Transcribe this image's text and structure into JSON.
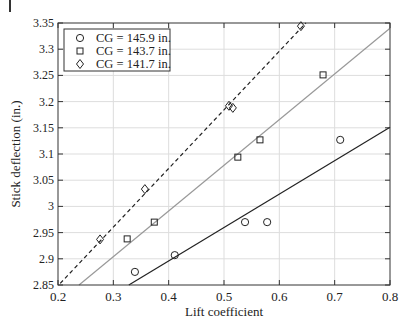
{
  "chart_data": {
    "type": "scatter",
    "title": "",
    "xlabel": "Lift coefficient",
    "ylabel": "Stick deflection (in.)",
    "xlim": [
      0.2,
      0.8
    ],
    "ylim": [
      2.85,
      3.35
    ],
    "grid": true,
    "legend_position": "upper left",
    "xticks": [
      "0.2",
      "0.3",
      "0.4",
      "0.5",
      "0.6",
      "0.7",
      "0.8"
    ],
    "yticks": [
      "2.85",
      "2.9",
      "2.95",
      "3",
      "3.05",
      "3.1",
      "3.15",
      "3.2",
      "3.25",
      "3.3",
      "3.35"
    ],
    "series": [
      {
        "name": "CG = 145.9 in.",
        "marker": "circle",
        "points": [
          [
            0.339,
            2.875
          ],
          [
            0.411,
            2.907
          ],
          [
            0.538,
            2.97
          ],
          [
            0.578,
            2.97
          ],
          [
            0.71,
            3.127
          ]
        ],
        "fit_line": {
          "style": "solid",
          "color": "#222222",
          "from": [
            0.328,
            2.85
          ],
          "to": [
            0.8,
            3.151
          ]
        }
      },
      {
        "name": "CG = 143.7 in.",
        "marker": "square",
        "points": [
          [
            0.325,
            2.938
          ],
          [
            0.374,
            2.97
          ],
          [
            0.525,
            3.094
          ],
          [
            0.565,
            3.127
          ],
          [
            0.679,
            3.251
          ]
        ],
        "fit_line": {
          "style": "solid",
          "color": "#999999",
          "from": [
            0.238,
            2.85
          ],
          "to": [
            0.8,
            3.34
          ]
        }
      },
      {
        "name": "CG = 141.7 in.",
        "marker": "diamond",
        "points": [
          [
            0.276,
            2.937
          ],
          [
            0.357,
            3.033
          ],
          [
            0.509,
            3.192
          ],
          [
            0.516,
            3.188
          ],
          [
            0.639,
            3.344
          ]
        ],
        "fit_line": {
          "style": "dashed",
          "color": "#222222",
          "from": [
            0.204,
            2.853
          ],
          "to": [
            0.648,
            3.35
          ]
        }
      }
    ]
  },
  "legend": {
    "items": [
      {
        "label": "CG = 145.9 in.",
        "marker": "circle"
      },
      {
        "label": "CG = 143.7 in.",
        "marker": "square"
      },
      {
        "label": "CG = 141.7 in.",
        "marker": "diamond"
      }
    ]
  },
  "axes": {
    "xlabel": "Lift coefficient",
    "ylabel": "Stick deflection (in.)"
  },
  "colors": {
    "axis": "#333333",
    "grid": "#dddddd",
    "marker": "#222222"
  }
}
